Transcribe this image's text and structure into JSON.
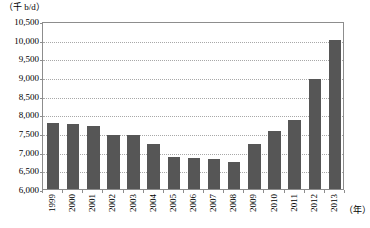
{
  "chart_data": {
    "type": "bar",
    "title": "",
    "subtitle": "",
    "unit_label": "（千 b/d）",
    "ylabel": "",
    "xlabel": "（年）",
    "categories": [
      "1999",
      "2000",
      "2001",
      "2002",
      "2003",
      "2004",
      "2005",
      "2006",
      "2007",
      "2008",
      "2009",
      "2010",
      "2011",
      "2012",
      "2013"
    ],
    "values": [
      7780,
      7730,
      7700,
      7450,
      7450,
      7200,
      6870,
      6840,
      6800,
      6730,
      7200,
      7550,
      7850,
      8950,
      10000
    ],
    "ylim": [
      6000,
      10500
    ],
    "ytick_step": 500,
    "ytick_labels": [
      "10,500",
      "10,000",
      "9,500",
      "9,000",
      "8,500",
      "8,000",
      "7,500",
      "7,000",
      "6,500",
      "6,000"
    ],
    "ytick_values": [
      10500,
      10000,
      9500,
      9000,
      8500,
      8000,
      7500,
      7000,
      6500,
      6000
    ],
    "grid": true,
    "grid_orientation": "horizontal",
    "legend": false,
    "legend_position": "none",
    "series": [
      {
        "name": "",
        "color": "#565656",
        "values": [
          7780,
          7730,
          7700,
          7450,
          7450,
          7200,
          6870,
          6840,
          6800,
          6730,
          7200,
          7550,
          7850,
          8950,
          10000
        ]
      }
    ],
    "axis_color": "#8d8d8d",
    "grid_color": "#a8a8a8",
    "background": "#ffffff",
    "xlabel_rotation": 90
  }
}
